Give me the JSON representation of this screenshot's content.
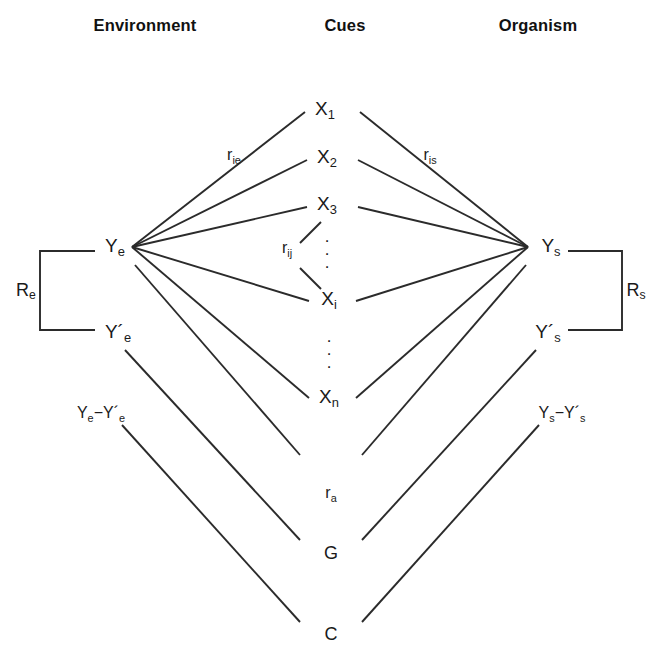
{
  "diagram": {
    "type": "lens-model-diagram",
    "stroke_color": "#2b2b2b",
    "text_color": "#1a1a1a",
    "background": "#ffffff",
    "width": 657,
    "height": 672
  },
  "headers": {
    "left": "Environment",
    "center": "Cues",
    "right": "Organism"
  },
  "nodes": {
    "environment_criterion": "Ye",
    "environment_prediction": "Y´e",
    "organism_judgment": "Ys",
    "organism_prediction": "Y´s",
    "cues": [
      {
        "label": "X1",
        "base": "X",
        "sub": "1",
        "y": 110
      },
      {
        "label": "X2",
        "base": "X",
        "sub": "2",
        "y": 158
      },
      {
        "label": "X3",
        "base": "X",
        "sub": "3",
        "y": 205
      },
      {
        "label": "Xi",
        "base": "X",
        "sub": "i",
        "y": 300
      },
      {
        "label": "Xn",
        "base": "X",
        "sub": "n",
        "y": 398
      }
    ],
    "vertical_ellipsis": "·"
  },
  "labels": {
    "ecological_validity": {
      "base": "r",
      "sub": "ie"
    },
    "cue_intercorrelation": {
      "base": "r",
      "sub": "ij"
    },
    "cue_utilization": {
      "base": "r",
      "sub": "is"
    },
    "environment_consistency": {
      "base": "R",
      "sub": "e"
    },
    "organism_consistency": {
      "base": "R",
      "sub": "s"
    },
    "environment_residual": "Ye−Y´e",
    "organism_residual": "Ys−Y´s",
    "matching_index": {
      "base": "r",
      "sub": "a"
    },
    "achievement": "G",
    "unmodeled_knowledge": "C"
  },
  "bracket_labels": {
    "left": "Re",
    "right": "Rs"
  }
}
